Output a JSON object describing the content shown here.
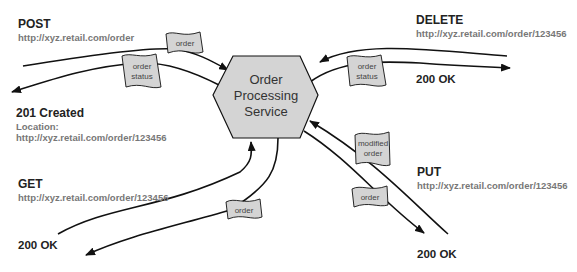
{
  "service": {
    "lines": [
      "Order",
      "Processing",
      "Service"
    ]
  },
  "post": {
    "verb": "POST",
    "url": "http://xyz.retail.com/order",
    "request_message": "order",
    "response_message_lines": [
      "order",
      "status"
    ],
    "status": "201 Created",
    "location_label": "Location:",
    "location_url": "http://xyz.retail.com/order/123456"
  },
  "delete": {
    "verb": "DELETE",
    "url": "http://xyz.retail.com/order/123456",
    "response_message_lines": [
      "order",
      "status"
    ],
    "status": "200 OK"
  },
  "get": {
    "verb": "GET",
    "url": "http://xyz.retail.com/order/123456",
    "response_message": "order",
    "status": "200 OK"
  },
  "put": {
    "verb": "PUT",
    "url": "http://xyz.retail.com/order/123456",
    "request_message_lines": [
      "modified",
      "order"
    ],
    "response_message": "order",
    "status": "200 OK"
  },
  "colors": {
    "shape_fill": "#d4d4d4",
    "stroke": "#111111",
    "url_text": "#777777"
  }
}
